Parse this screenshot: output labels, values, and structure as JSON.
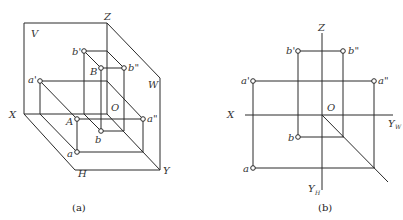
{
  "figures": [
    {
      "id": "a",
      "caption": "(a)",
      "labels": {
        "plane_v": "V",
        "plane_w": "W",
        "plane_h": "H",
        "axis_x": "X",
        "axis_y": "Y",
        "axis_z": "Z",
        "origin": "O",
        "point_A": "A",
        "point_B": "B",
        "point_a_front": "a'",
        "point_a_top": "a",
        "point_a_side": "a\"",
        "point_b_front": "b'",
        "point_b_top": "b",
        "point_b_side": "b\""
      }
    },
    {
      "id": "b",
      "caption": "(b)",
      "labels": {
        "axis_x": "X",
        "axis_z": "Z",
        "axis_yw": "Y",
        "axis_yw_sub": "W",
        "axis_yh": "Y",
        "axis_yh_sub": "H",
        "origin": "O",
        "point_a_front": "a'",
        "point_a_top": "a",
        "point_a_side": "a\"",
        "point_b_front": "b'",
        "point_b_top": "b",
        "point_b_side": "b\""
      }
    }
  ]
}
